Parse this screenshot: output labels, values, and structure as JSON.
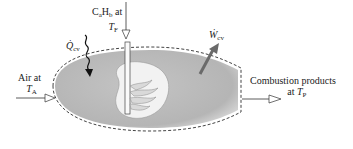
{
  "diagram": {
    "fuel": {
      "formula_C": "C",
      "sub_a": "a",
      "formula_H": "H",
      "sub_b": "b",
      "at": " at",
      "temp_symbol": "T",
      "temp_sub": "F"
    },
    "heat": {
      "symbol": "Q̇",
      "sub": "cv"
    },
    "work": {
      "symbol": "Ẇ",
      "sub": "cv"
    },
    "air": {
      "line1": "Air at",
      "temp_symbol": "T",
      "temp_sub": "A"
    },
    "products": {
      "line1": "Combustion products",
      "at": "at ",
      "temp_symbol": "T",
      "temp_sub": "P"
    },
    "colors": {
      "control_volume_fill": "#b9b9b9",
      "control_volume_edge": "#d4d4d4",
      "flame_region_fill": "#f2f2f2",
      "boundary_dash": "#444444",
      "work_arrow": "#6a6a6a",
      "lines": "#333333"
    }
  }
}
